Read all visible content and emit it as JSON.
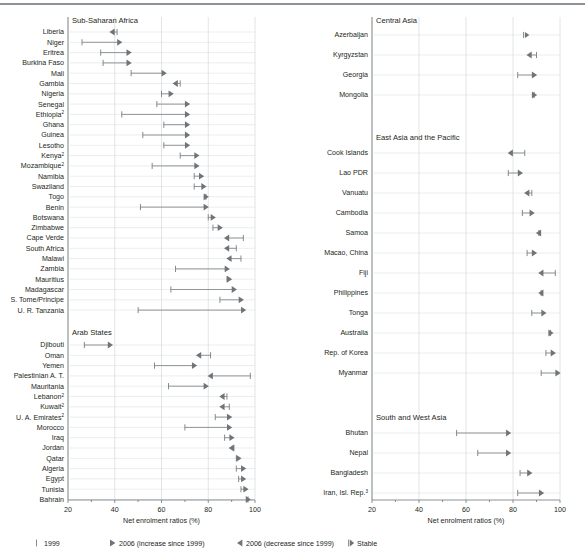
{
  "figure": {
    "axis_title": "Net enrolment ratios (%)",
    "x_ticks": [
      20,
      40,
      60,
      80,
      100
    ],
    "xlim": [
      20,
      100
    ],
    "accent_color": "#6f7478",
    "grid_color": "#c9cdd0",
    "rule_color": "#8d9296"
  },
  "legend": {
    "items": [
      {
        "glyph": "bar-marker",
        "label": "1999"
      },
      {
        "glyph": "right-triangle-marker",
        "label": "2006 (increase since 1999)"
      },
      {
        "glyph": "left-triangle-marker",
        "label": "2006 (decrease since 1999)"
      },
      {
        "glyph": "stable-marker",
        "label": "Stable"
      }
    ]
  },
  "chart_data": {
    "type": "dumbbell",
    "title": "",
    "xlabel": "Net enrolment ratios (%)",
    "ylabel": "",
    "xlim": [
      20,
      100
    ],
    "xticks": [
      20,
      40,
      60,
      80,
      100
    ],
    "grid": true,
    "legend_position": "bottom",
    "series": [
      {
        "name": "1999",
        "marker": "bar"
      },
      {
        "name": "2006",
        "marker": "triangle"
      }
    ],
    "panels": [
      {
        "id": "sub-saharan-africa",
        "group": "Sub-Saharan Africa",
        "column": "left",
        "rows": [
          {
            "country": "Liberia",
            "note": "",
            "v1999": 41.0,
            "v2006": 38.0,
            "state": "decrease"
          },
          {
            "country": "Niger",
            "note": "",
            "v1999": 26.0,
            "v2006": 43.0,
            "state": "increase"
          },
          {
            "country": "Eritrea",
            "note": "",
            "v1999": 34.0,
            "v2006": 47.0,
            "state": "increase"
          },
          {
            "country": "Burkina Faso",
            "note": "",
            "v1999": 35.0,
            "v2006": 47.0,
            "state": "increase"
          },
          {
            "country": "Mali",
            "note": "",
            "v1999": 47.0,
            "v2006": 62.0,
            "state": "increase"
          },
          {
            "country": "Gambia",
            "note": "",
            "v1999": 68.0,
            "v2006": 65.0,
            "state": "decrease"
          },
          {
            "country": "Nigeria",
            "note": "",
            "v1999": 60.0,
            "v2006": 65.0,
            "state": "increase"
          },
          {
            "country": "Senegal",
            "note": "",
            "v1999": 58.0,
            "v2006": 72.0,
            "state": "increase"
          },
          {
            "country": "Ethiopia",
            "note": "2",
            "v1999": 43.0,
            "v2006": 72.0,
            "state": "increase"
          },
          {
            "country": "Ghana",
            "note": "",
            "v1999": 61.0,
            "v2006": 72.0,
            "state": "increase"
          },
          {
            "country": "Guinea",
            "note": "",
            "v1999": 52.0,
            "v2006": 72.0,
            "state": "increase"
          },
          {
            "country": "Lesotho",
            "note": "",
            "v1999": 61.0,
            "v2006": 72.0,
            "state": "increase"
          },
          {
            "country": "Kenya",
            "note": "2",
            "v1999": 68.0,
            "v2006": 76.0,
            "state": "increase"
          },
          {
            "country": "Mozambique",
            "note": "2",
            "v1999": 56.0,
            "v2006": 76.0,
            "state": "increase"
          },
          {
            "country": "Namibia",
            "note": "",
            "v1999": 74.0,
            "v2006": 78.0,
            "state": "increase"
          },
          {
            "country": "Swaziland",
            "note": "",
            "v1999": 74.0,
            "v2006": 79.0,
            "state": "increase"
          },
          {
            "country": "Togo",
            "note": "",
            "v1999": 79.0,
            "v2006": 80.0,
            "state": "increase"
          },
          {
            "country": "Benin",
            "note": "",
            "v1999": 51.0,
            "v2006": 80.0,
            "state": "increase"
          },
          {
            "country": "Botswana",
            "note": "",
            "v1999": 80.0,
            "v2006": 83.0,
            "state": "increase"
          },
          {
            "country": "Zimbabwe",
            "note": "",
            "v1999": 82.0,
            "v2006": 86.0,
            "state": "increase"
          },
          {
            "country": "Cape Verde",
            "note": "",
            "v1999": 95.0,
            "v2006": 87.0,
            "state": "decrease"
          },
          {
            "country": "South Africa",
            "note": "",
            "v1999": 92.0,
            "v2006": 87.0,
            "state": "decrease"
          },
          {
            "country": "Malawi",
            "note": "",
            "v1999": 94.0,
            "v2006": 88.0,
            "state": "decrease"
          },
          {
            "country": "Zambia",
            "note": "",
            "v1999": 66.0,
            "v2006": 89.0,
            "state": "increase"
          },
          {
            "country": "Mauritius",
            "note": "",
            "v1999": 88.0,
            "v2006": 90.0,
            "state": "increase"
          },
          {
            "country": "Madagascar",
            "note": "",
            "v1999": 64.0,
            "v2006": 92.0,
            "state": "increase"
          },
          {
            "country": "S. Tome/Principe",
            "note": "",
            "v1999": 85.0,
            "v2006": 95.0,
            "state": "increase"
          },
          {
            "country": "U. R. Tanzania",
            "note": "",
            "v1999": 50.0,
            "v2006": 96.0,
            "state": "increase"
          }
        ]
      },
      {
        "id": "arab-states",
        "group": "Arab States",
        "column": "left",
        "rows": [
          {
            "country": "Djibouti",
            "note": "",
            "v1999": 27.0,
            "v2006": 39.0,
            "state": "increase"
          },
          {
            "country": "Oman",
            "note": "",
            "v1999": 81.0,
            "v2006": 75.0,
            "state": "decrease"
          },
          {
            "country": "Yemen",
            "note": "",
            "v1999": 57.0,
            "v2006": 75.0,
            "state": "increase"
          },
          {
            "country": "Palestinian A. T.",
            "note": "",
            "v1999": 98.0,
            "v2006": 80.0,
            "state": "decrease"
          },
          {
            "country": "Mauritania",
            "note": "",
            "v1999": 63.0,
            "v2006": 80.0,
            "state": "increase"
          },
          {
            "country": "Lebanon",
            "note": "2",
            "v1999": 88.0,
            "v2006": 85.0,
            "state": "decrease"
          },
          {
            "country": "Kuwait",
            "note": "2",
            "v1999": 89.0,
            "v2006": 85.0,
            "state": "decrease"
          },
          {
            "country": "U. A. Emirates",
            "note": "2",
            "v1999": 83.0,
            "v2006": 90.0,
            "state": "increase"
          },
          {
            "country": "Morocco",
            "note": "",
            "v1999": 70.0,
            "v2006": 90.0,
            "state": "increase"
          },
          {
            "country": "Iraq",
            "note": "",
            "v1999": 87.0,
            "v2006": 91.0,
            "state": "increase"
          },
          {
            "country": "Jordan",
            "note": "",
            "v1999": 91.0,
            "v2006": 89.0,
            "state": "decrease"
          },
          {
            "country": "Qatar",
            "note": "",
            "v1999": 92.0,
            "v2006": 94.0,
            "state": "increase"
          },
          {
            "country": "Algeria",
            "note": "",
            "v1999": 92.0,
            "v2006": 96.0,
            "state": "increase"
          },
          {
            "country": "Egypt",
            "note": "",
            "v1999": 93.0,
            "v2006": 96.0,
            "state": "increase"
          },
          {
            "country": "Tunisia",
            "note": "",
            "v1999": 94.0,
            "v2006": 97.0,
            "state": "increase"
          },
          {
            "country": "Bahrain",
            "note": "",
            "v1999": 97.0,
            "v2006": 98.0,
            "state": "increase"
          }
        ]
      },
      {
        "id": "central-asia",
        "group": "Central Asia",
        "column": "right",
        "rows": [
          {
            "country": "Azerbaijan",
            "note": "",
            "v1999": 85.0,
            "v2006": 85.0,
            "state": "stable"
          },
          {
            "country": "Kyrgyzstan",
            "note": "",
            "v1999": 90.0,
            "v2006": 86.0,
            "state": "decrease"
          },
          {
            "country": "Georgia",
            "note": "",
            "v1999": 82.0,
            "v2006": 90.0,
            "state": "increase"
          },
          {
            "country": "Mongolia",
            "note": "",
            "v1999": 89.0,
            "v2006": 90.0,
            "state": "increase"
          }
        ]
      },
      {
        "id": "east-asia-and-the-pacific",
        "group": "East Asia and the Pacific",
        "column": "right",
        "rows": [
          {
            "country": "Cook Islands",
            "note": "",
            "v1999": 85.0,
            "v2006": 78.0,
            "state": "decrease"
          },
          {
            "country": "Lao PDR",
            "note": "",
            "v1999": 78.0,
            "v2006": 84.0,
            "state": "increase"
          },
          {
            "country": "Vanuatu",
            "note": "",
            "v1999": 88.0,
            "v2006": 85.0,
            "state": "decrease"
          },
          {
            "country": "Cambodia",
            "note": "",
            "v1999": 84.0,
            "v2006": 89.0,
            "state": "increase"
          },
          {
            "country": "Samoa",
            "note": "",
            "v1999": 91.0,
            "v2006": 90.0,
            "state": "decrease"
          },
          {
            "country": "Macao, China",
            "note": "",
            "v1999": 86.0,
            "v2006": 90.0,
            "state": "increase"
          },
          {
            "country": "Fiji",
            "note": "",
            "v1999": 98.0,
            "v2006": 91.0,
            "state": "decrease"
          },
          {
            "country": "Philippines",
            "note": "",
            "v1999": 92.0,
            "v2006": 91.0,
            "state": "decrease"
          },
          {
            "country": "Tonga",
            "note": "",
            "v1999": 88.0,
            "v2006": 94.0,
            "state": "increase"
          },
          {
            "country": "Australia",
            "note": "",
            "v1999": 96.0,
            "v2006": 97.0,
            "state": "increase"
          },
          {
            "country": "Rep. of Korea",
            "note": "",
            "v1999": 94.0,
            "v2006": 98.0,
            "state": "increase"
          },
          {
            "country": "Myanmar",
            "note": "",
            "v1999": 92.0,
            "v2006": 100.0,
            "state": "increase"
          }
        ]
      },
      {
        "id": "south-and-west-asia",
        "group": "South and West Asia",
        "column": "right",
        "rows": [
          {
            "country": "Bhutan",
            "note": "",
            "v1999": 56.0,
            "v2006": 79.0,
            "state": "increase"
          },
          {
            "country": "Nepal",
            "note": "",
            "v1999": 65.0,
            "v2006": 79.0,
            "state": "increase"
          },
          {
            "country": "Bangladesh",
            "note": "",
            "v1999": 83.0,
            "v2006": 88.0,
            "state": "increase"
          },
          {
            "country": "Iran, Isl. Rep.",
            "note": "3",
            "v1999": 82.0,
            "v2006": 93.0,
            "state": "increase"
          }
        ]
      }
    ]
  }
}
